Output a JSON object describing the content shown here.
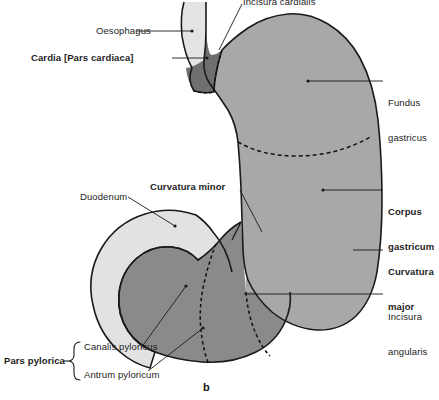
{
  "figure": {
    "panel_label": "b",
    "title_visible": false,
    "background_color": "#ffffff",
    "outline_color": "#1a1a1a"
  },
  "palette": {
    "oesophagus_fill": "#e4e4e4",
    "duodenum_fill": "#e2e2e2",
    "stomach_body_fill": "#a8a8a8",
    "pylorus_fill": "#8a8a8a",
    "cardia_fill": "#6f6f6f",
    "leader_line_color": "#1a1a1a",
    "dashed_line_color": "#111111"
  },
  "labels": {
    "incisura_cardialis": {
      "text": "Incisura cardialis",
      "bold": false,
      "side": "top",
      "clipped": true
    },
    "oesophagus": {
      "text": "Oesophagus",
      "bold": false,
      "side": "left"
    },
    "cardia": {
      "text": "Cardia [Pars cardiaca]",
      "bold": true,
      "side": "left"
    },
    "fundus_gastricus": {
      "text": "Fundus\ngastricus",
      "line1": "Fundus",
      "line2": "gastricus",
      "bold": false,
      "side": "right"
    },
    "corpus_gastricum": {
      "line1": "Corpus",
      "line2": "gastricum",
      "bold": true,
      "side": "right"
    },
    "curvatura_major": {
      "line1": "Curvatura",
      "line2": "major",
      "bold": true,
      "side": "right"
    },
    "incisura_angularis": {
      "line1": "Incisura",
      "line2": "angularis",
      "bold": false,
      "side": "right"
    },
    "curvatura_minor": {
      "text": "Curvatura minor",
      "bold": true,
      "side": "top-center"
    },
    "duodenum": {
      "text": "Duodenum",
      "bold": false,
      "side": "left"
    },
    "pars_pylorica": {
      "text": "Pars pylorica",
      "bold": true,
      "side": "left",
      "brace": true,
      "children": [
        {
          "text": "Canalis pyloricus",
          "bold": false
        },
        {
          "text": "Antrum pyloricum",
          "bold": false
        }
      ]
    }
  },
  "regions": [
    {
      "name": "oesophagus",
      "shade": "light"
    },
    {
      "name": "cardia-pars-cardiaca",
      "shade": "dark"
    },
    {
      "name": "fundus-gastricus",
      "shade": "medium"
    },
    {
      "name": "corpus-gastricum",
      "shade": "medium"
    },
    {
      "name": "pars-pylorica-antrum",
      "shade": "mid-dark"
    },
    {
      "name": "canalis-pyloricus",
      "shade": "mid-dark"
    },
    {
      "name": "duodenum",
      "shade": "light"
    }
  ]
}
